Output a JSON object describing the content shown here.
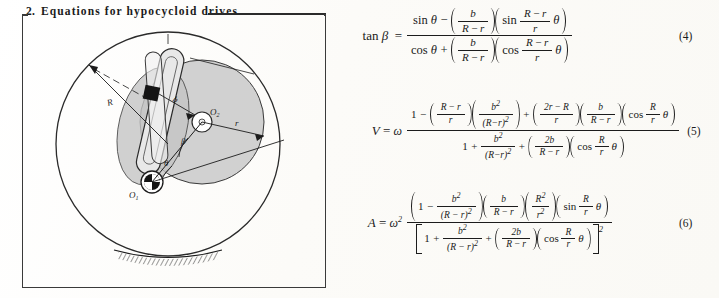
{
  "page": {
    "background_color": "#fdfdfb",
    "ink_color": "#1c1c1c"
  },
  "heading": {
    "number": "2.",
    "title": "Equations for hypocycloid drives",
    "rule": "horizontal-rule"
  },
  "figure": {
    "caption": "",
    "border": "rectangular-frame",
    "labels": {
      "outer_radius": "R",
      "inner_radius": "r",
      "link_length": "b",
      "angle_beta": "β",
      "angle_theta": "θ",
      "fixed_center": "O",
      "fixed_center_sub": "1",
      "moving_center": "O",
      "moving_center_sub": "2"
    },
    "ground": "hatched-ground-support"
  },
  "equations": [
    {
      "id": "eq-4",
      "number": "(4)",
      "lhs": "tan β =",
      "lhs_symbol": "tan",
      "lhs_var": "β",
      "numerator": "sin θ − ( b / (R − r) )( sin ((R − r)/r) θ )",
      "denominator": "cos θ + ( b / (R − r) )( cos ((R − r)/r) θ )",
      "parts": {
        "num_first_fn": "sin",
        "num_first_arg": "θ",
        "num_op": "−",
        "num_frac_nu": "b",
        "num_frac_de_a": "R",
        "num_frac_de_op": "−",
        "num_frac_de_b": "r",
        "num_second_fn": "sin",
        "num_inner_nu_a": "R",
        "num_inner_nu_op": "−",
        "num_inner_nu_b": "r",
        "num_inner_de": "r",
        "num_inner_tail": "θ",
        "den_first_fn": "cos",
        "den_first_arg": "θ",
        "den_op": "+",
        "den_frac_nu": "b",
        "den_frac_de_a": "R",
        "den_frac_de_op": "−",
        "den_frac_de_b": "r",
        "den_second_fn": "cos",
        "den_inner_nu_a": "R",
        "den_inner_nu_op": "−",
        "den_inner_nu_b": "r",
        "den_inner_de": "r",
        "den_inner_tail": "θ"
      }
    },
    {
      "id": "eq-5",
      "number": "(5)",
      "lhs": "V = ω",
      "lhs_var": "V",
      "lhs_eq": "=",
      "lhs_omega": "ω",
      "numerator": "1 − ((R−r)/r)( b²/(R−r)² ) + ((2r−R)/r)( b/(R−r) )( cos (R/r) θ )",
      "denominator": "1 + b²/(R−r)² + ( 2b/(R−r) )( cos (R/r) θ )",
      "parts": {
        "num_one": "1",
        "num_minus": "−",
        "num_f1_nu_a": "R",
        "num_f1_nu_op": "−",
        "num_f1_nu_b": "r",
        "num_f1_de": "r",
        "num_f2_nu": "b",
        "num_f2_nu_sup": "2",
        "num_f2_de": "(R−r)",
        "num_f2_de_sup": "2",
        "num_plus": "+",
        "num_f3_nu_a": "2r",
        "num_f3_nu_op": "−",
        "num_f3_nu_b": "R",
        "num_f3_de": "r",
        "num_f4_nu": "b",
        "num_f4_de_a": "R",
        "num_f4_de_op": "−",
        "num_f4_de_b": "r",
        "num_cos": "cos",
        "num_cos_nu": "R",
        "num_cos_de": "r",
        "num_cos_tail": "θ",
        "den_one": "1",
        "den_plus1": "+",
        "den_f1_nu": "b",
        "den_f1_nu_sup": "2",
        "den_f1_de": "(R−r)",
        "den_f1_de_sup": "2",
        "den_plus2": "+",
        "den_f2_nu": "2b",
        "den_f2_de_a": "R",
        "den_f2_de_op": "−",
        "den_f2_de_b": "r",
        "den_cos": "cos",
        "den_cos_nu": "R",
        "den_cos_de": "r",
        "den_cos_tail": "θ"
      }
    },
    {
      "id": "eq-6",
      "number": "(6)",
      "lhs": "A = ω²",
      "lhs_var": "A",
      "lhs_eq": "=",
      "lhs_omega": "ω",
      "lhs_omega_sup": "2",
      "numerator": "( 1 − b²/(R−r)² )( b/(R−r) )( R²/r² )( sin (R/r) θ )",
      "denominator": "[ 1 + b²/(R−r)² + ( 2b/(R−r) )( cos (R/r) θ ) ]²",
      "parts": {
        "num_one": "1",
        "num_minus": "−",
        "num_f1_nu": "b",
        "num_f1_nu_sup": "2",
        "num_f1_de": "(R − r)",
        "num_f1_de_sup": "2",
        "num_f2_nu": "b",
        "num_f2_de_a": "R",
        "num_f2_de_op": "−",
        "num_f2_de_b": "r",
        "num_f3_nu": "R",
        "num_f3_nu_sup": "2",
        "num_f3_de": "r",
        "num_f3_de_sup": "2",
        "num_sin": "sin",
        "num_sin_nu": "R",
        "num_sin_de": "r",
        "num_sin_tail": "θ",
        "den_one": "1",
        "den_plus1": "+",
        "den_f1_nu": "b",
        "den_f1_nu_sup": "2",
        "den_f1_de": "(R − r)",
        "den_f1_de_sup": "2",
        "den_plus2": "+",
        "den_f2_nu": "2b",
        "den_f2_de_a": "R",
        "den_f2_de_op": "−",
        "den_f2_de_b": "r",
        "den_cos": "cos",
        "den_cos_nu": "R",
        "den_cos_de": "r",
        "den_cos_tail": "θ",
        "den_bracket_sup": "2"
      }
    }
  ]
}
